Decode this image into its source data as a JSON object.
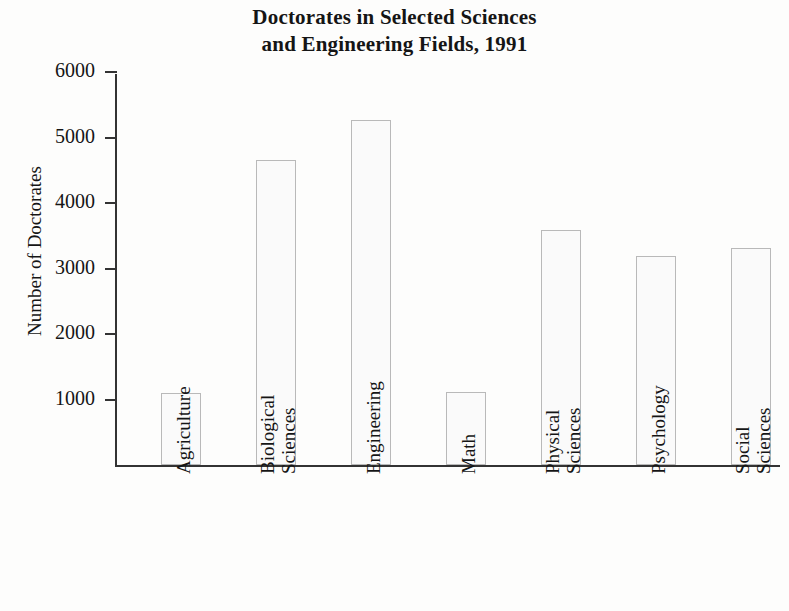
{
  "chart_data": {
    "type": "bar",
    "title": "Doctorates in Selected Sciences and Engineering Fields, 1991",
    "title_lines": [
      "Doctorates in Selected Sciences",
      "and Engineering Fields, 1991"
    ],
    "xlabel": "",
    "ylabel": "Number of Doctorates",
    "categories": [
      "Agriculture",
      "Biological Sciences",
      "Engineering",
      "Math",
      "Physical Sciences",
      "Psychology",
      "Social Sciences"
    ],
    "category_lines": [
      [
        "Agriculture"
      ],
      [
        "Biological",
        "Sciences"
      ],
      [
        "Engineering"
      ],
      [
        "Math"
      ],
      [
        "Physical",
        "Sciences"
      ],
      [
        "Psychology"
      ],
      [
        "Social",
        "Sciences"
      ]
    ],
    "values": [
      1100,
      4650,
      5270,
      1120,
      3590,
      3190,
      3310
    ],
    "ylim": [
      0,
      6000
    ],
    "yticks": [
      1000,
      2000,
      3000,
      4000,
      5000,
      6000
    ],
    "ytick_labels": [
      "1000",
      "2000",
      "3000",
      "4000",
      "5000",
      "6000"
    ],
    "grid": false,
    "legend": false,
    "bar_fill_color": "#fafafa",
    "bar_edge_color": "#b9b9b9",
    "axis_color": "#333333",
    "text_color": "#151515",
    "background_color": "#fdfdfc"
  }
}
